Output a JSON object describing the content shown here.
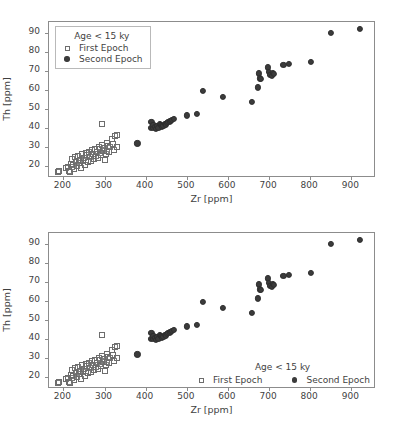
{
  "figure": {
    "panels": [
      {
        "id": "top",
        "legend_position": "upper-left",
        "legend_layout": "vertical",
        "legend_framed": true
      },
      {
        "id": "bottom",
        "legend_position": "lower-right",
        "legend_layout": "horizontal",
        "legend_framed": false
      }
    ]
  },
  "legend": {
    "title": "Age < 15 ky",
    "entries": [
      {
        "label": "First Epoch",
        "marker": "open-square-marker",
        "color": "#6d6d6d"
      },
      {
        "label": "Second Epoch",
        "marker": "filled-circle-marker",
        "color": "#3b3b3b"
      }
    ]
  },
  "chart_data": {
    "type": "scatter",
    "title": "",
    "xlabel": "Zr [ppm]",
    "ylabel": "Th [ppm]",
    "xlim": [
      165,
      960
    ],
    "ylim": [
      13.5,
      96
    ],
    "xticks": [
      200,
      300,
      400,
      500,
      600,
      700,
      800,
      900
    ],
    "yticks": [
      20,
      30,
      40,
      50,
      60,
      70,
      80,
      90
    ],
    "grid": false,
    "legend_entries": [
      "First Epoch",
      "Second Epoch"
    ],
    "annotations": [
      "Age < 15 ky"
    ],
    "series": [
      {
        "name": "First Epoch",
        "marker": "square",
        "color": "#6d6d6d",
        "points": [
          [
            186,
            16.6
          ],
          [
            190,
            17.4
          ],
          [
            206,
            18.6
          ],
          [
            211,
            19.2
          ],
          [
            213,
            17.0
          ],
          [
            216,
            16.8
          ],
          [
            218,
            21.0
          ],
          [
            220,
            19.4
          ],
          [
            222,
            23.6
          ],
          [
            224,
            20.2
          ],
          [
            226,
            18.2
          ],
          [
            228,
            24.4
          ],
          [
            231,
            22.0
          ],
          [
            233,
            19.6
          ],
          [
            236,
            25.0
          ],
          [
            238,
            21.4
          ],
          [
            240,
            23.2
          ],
          [
            242,
            18.8
          ],
          [
            245,
            26.0
          ],
          [
            247,
            22.6
          ],
          [
            249,
            24.0
          ],
          [
            252,
            20.6
          ],
          [
            254,
            26.6
          ],
          [
            256,
            23.0
          ],
          [
            258,
            25.6
          ],
          [
            261,
            21.8
          ],
          [
            263,
            27.4
          ],
          [
            265,
            24.6
          ],
          [
            268,
            22.4
          ],
          [
            270,
            28.2
          ],
          [
            272,
            26.2
          ],
          [
            274,
            23.8
          ],
          [
            277,
            29.0
          ],
          [
            279,
            25.2
          ],
          [
            281,
            27.0
          ],
          [
            284,
            24.2
          ],
          [
            286,
            30.0
          ],
          [
            288,
            26.8
          ],
          [
            290,
            28.6
          ],
          [
            292,
            25.4
          ],
          [
            293,
            42.0
          ],
          [
            295,
            31.0
          ],
          [
            297,
            27.6
          ],
          [
            299,
            29.4
          ],
          [
            301,
            23.0
          ],
          [
            303,
            26.4
          ],
          [
            305,
            32.0
          ],
          [
            307,
            28.0
          ],
          [
            309,
            30.2
          ],
          [
            312,
            27.2
          ],
          [
            314,
            29.8
          ],
          [
            317,
            34.2
          ],
          [
            320,
            31.4
          ],
          [
            323,
            28.4
          ],
          [
            326,
            35.8
          ],
          [
            330,
            36.2
          ],
          [
            331,
            29.8
          ]
        ]
      },
      {
        "name": "Second Epoch",
        "marker": "circle",
        "color": "#3b3b3b",
        "points": [
          [
            380,
            31.8
          ],
          [
            412,
            40.2
          ],
          [
            414,
            43.2
          ],
          [
            417,
            39.8
          ],
          [
            419,
            41.4
          ],
          [
            422,
            40.6
          ],
          [
            425,
            39.4
          ],
          [
            428,
            41.0
          ],
          [
            431,
            40.0
          ],
          [
            434,
            42.2
          ],
          [
            437,
            41.6
          ],
          [
            440,
            40.8
          ],
          [
            443,
            41.2
          ],
          [
            446,
            42.0
          ],
          [
            449,
            41.8
          ],
          [
            452,
            42.6
          ],
          [
            455,
            43.0
          ],
          [
            458,
            43.4
          ],
          [
            461,
            43.8
          ],
          [
            464,
            44.2
          ],
          [
            468,
            44.6
          ],
          [
            500,
            46.6
          ],
          [
            525,
            47.4
          ],
          [
            540,
            59.6
          ],
          [
            588,
            56.2
          ],
          [
            658,
            53.8
          ],
          [
            672,
            61.4
          ],
          [
            676,
            68.8
          ],
          [
            678,
            66.2
          ],
          [
            680,
            65.8
          ],
          [
            697,
            72.0
          ],
          [
            700,
            69.6
          ],
          [
            703,
            68.0
          ],
          [
            706,
            67.4
          ],
          [
            709,
            69.0
          ],
          [
            712,
            68.4
          ],
          [
            735,
            73.2
          ],
          [
            748,
            73.8
          ],
          [
            801,
            74.8
          ],
          [
            851,
            90.2
          ],
          [
            920,
            92.4
          ]
        ]
      }
    ]
  }
}
